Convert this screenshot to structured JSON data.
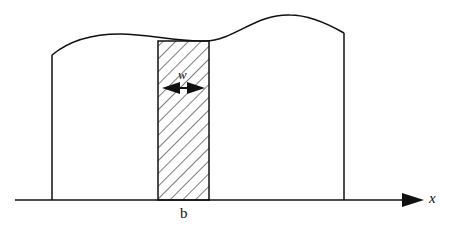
{
  "diagram": {
    "type": "cross-section schematic",
    "labels": {
      "width": "w",
      "position": "b",
      "axis": "x"
    },
    "colors": {
      "stroke": "#111111",
      "background": "#ffffff"
    },
    "elements": [
      {
        "name": "x-axis",
        "description": "horizontal axis with arrowhead pointing right"
      },
      {
        "name": "outer-profile",
        "description": "region bounded by two vertical walls and a wavy top curve"
      },
      {
        "name": "hatched-strip",
        "description": "diagonally hatched vertical strip of width w located at b"
      },
      {
        "name": "width-arrow",
        "description": "double-headed arrow across the strip indicating width w"
      }
    ]
  }
}
